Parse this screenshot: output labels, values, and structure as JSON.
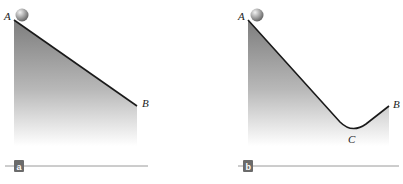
{
  "panels": [
    {
      "id": "a",
      "badge": "a",
      "points": {
        "A": "A",
        "B": "B"
      },
      "description": "straight incline from A down to B"
    },
    {
      "id": "b",
      "badge": "b",
      "points": {
        "A": "A",
        "B": "B",
        "C": "C"
      },
      "description": "valley track from A down to C and up to B"
    }
  ],
  "colors": {
    "track": "#1a1a1a",
    "fill_top": "#8a8a8a",
    "fill_bottom": "#ffffff",
    "baseline": "#9a9a9a",
    "badge": "#6b6b6b",
    "ball": "#9c9c9c"
  }
}
